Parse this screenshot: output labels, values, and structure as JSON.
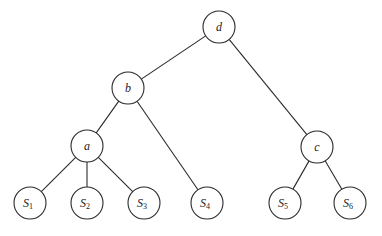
{
  "diagram": {
    "type": "tree",
    "node_radius": 16,
    "nodes": [
      {
        "id": "d",
        "label": "d",
        "sub": "",
        "x": 219,
        "y": 27
      },
      {
        "id": "b",
        "label": "b",
        "sub": "",
        "x": 128,
        "y": 88
      },
      {
        "id": "a",
        "label": "a",
        "sub": "",
        "x": 87,
        "y": 146
      },
      {
        "id": "c",
        "label": "c",
        "sub": "",
        "x": 317,
        "y": 147
      },
      {
        "id": "S1",
        "label": "S",
        "sub": "1",
        "x": 30,
        "y": 203
      },
      {
        "id": "S2",
        "label": "S",
        "sub": "2",
        "x": 87,
        "y": 203
      },
      {
        "id": "S3",
        "label": "S",
        "sub": "3",
        "x": 144,
        "y": 203
      },
      {
        "id": "S4",
        "label": "S",
        "sub": "4",
        "x": 207,
        "y": 203
      },
      {
        "id": "S5",
        "label": "S",
        "sub": "5",
        "x": 285,
        "y": 203
      },
      {
        "id": "S6",
        "label": "S",
        "sub": "6",
        "x": 350,
        "y": 203
      }
    ],
    "edges": [
      [
        "d",
        "b"
      ],
      [
        "d",
        "c"
      ],
      [
        "b",
        "a"
      ],
      [
        "b",
        "S4"
      ],
      [
        "a",
        "S1"
      ],
      [
        "a",
        "S2"
      ],
      [
        "a",
        "S3"
      ],
      [
        "c",
        "S5"
      ],
      [
        "c",
        "S6"
      ]
    ]
  }
}
